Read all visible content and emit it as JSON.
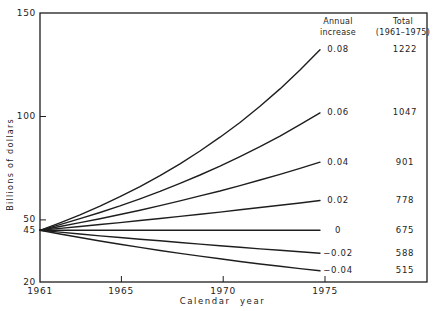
{
  "chart_data": {
    "type": "line",
    "title": "",
    "xlabel": "Calendar year",
    "ylabel": "Billions of dollars",
    "xlim": [
      1961,
      1975
    ],
    "ylim": [
      20,
      150
    ],
    "x_ticks": [
      1961,
      1965,
      1970,
      1975
    ],
    "y_ticks": [
      150,
      100,
      50,
      45,
      20
    ],
    "grid": false,
    "line_color": "#1e1e1e",
    "background": "#ffffff",
    "start_year": 1961,
    "start_value": 45,
    "end_year": 1975,
    "years": [
      1961,
      1962,
      1963,
      1964,
      1965,
      1966,
      1967,
      1968,
      1969,
      1970,
      1971,
      1972,
      1973,
      1974,
      1975
    ],
    "legend": {
      "col1_header_line1": "Annual",
      "col1_header_line2": "increase",
      "col2_header_line1": "Total",
      "col2_header_line2": "(1961–1975)"
    },
    "series": [
      {
        "rate": 0.08,
        "rate_label": "0.08",
        "total": 1222,
        "end_value": 132.2,
        "values": [
          45,
          48.6,
          52.5,
          56.7,
          61.2,
          66.1,
          71.4,
          77.1,
          83.3,
          90.0,
          97.1,
          104.9,
          113.3,
          122.4,
          132.2
        ]
      },
      {
        "rate": 0.06,
        "rate_label": "0.06",
        "total": 1047,
        "end_value": 101.7,
        "values": [
          45,
          47.7,
          50.6,
          53.6,
          56.8,
          60.2,
          63.8,
          67.7,
          71.7,
          76.0,
          80.6,
          85.4,
          90.5,
          96.0,
          101.7
        ]
      },
      {
        "rate": 0.04,
        "rate_label": "0.04",
        "total": 901,
        "end_value": 77.9,
        "values": [
          45,
          46.8,
          48.7,
          50.6,
          52.6,
          54.7,
          56.9,
          59.2,
          61.6,
          64.0,
          66.6,
          69.3,
          72.0,
          74.9,
          77.9
        ]
      },
      {
        "rate": 0.02,
        "rate_label": "0.02",
        "total": 778,
        "end_value": 59.4,
        "values": [
          45,
          45.9,
          46.8,
          47.8,
          48.7,
          49.7,
          50.7,
          51.7,
          52.7,
          53.8,
          54.9,
          56.0,
          57.1,
          58.2,
          59.4
        ]
      },
      {
        "rate": 0,
        "rate_label": "0",
        "total": 675,
        "end_value": 45,
        "values": [
          45,
          45,
          45,
          45,
          45,
          45,
          45,
          45,
          45,
          45,
          45,
          45,
          45,
          45,
          45
        ]
      },
      {
        "rate": -0.02,
        "rate_label": "−0.02",
        "total": 588,
        "end_value": 33.9,
        "values": [
          45,
          44.1,
          43.2,
          42.3,
          41.5,
          40.7,
          39.9,
          39.1,
          38.3,
          37.5,
          36.8,
          36.0,
          35.3,
          34.6,
          33.9
        ]
      },
      {
        "rate": -0.04,
        "rate_label": "−0.04",
        "total": 515,
        "end_value": 25.4,
        "values": [
          45,
          43.2,
          41.5,
          39.8,
          38.2,
          36.7,
          35.2,
          33.8,
          32.5,
          31.2,
          29.9,
          28.7,
          27.6,
          26.5,
          25.4
        ]
      }
    ]
  }
}
